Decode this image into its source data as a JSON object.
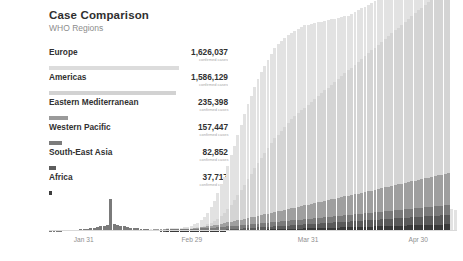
{
  "header": {
    "title": "Case Comparison",
    "subtitle": "WHO Regions"
  },
  "legend": {
    "value_sublabel": "confirmed cases",
    "items": [
      {
        "label": "Europe",
        "value": "1,626,037",
        "numeric": 1626037,
        "color": "#dcdcdc"
      },
      {
        "label": "Americas",
        "value": "1,586,129",
        "numeric": 1586129,
        "color": "#d2d2d2"
      },
      {
        "label": "Eastern Mediterranean",
        "value": "235,398",
        "numeric": 235398,
        "color": "#9a9a9a"
      },
      {
        "label": "Western Pacific",
        "value": "157,447",
        "numeric": 157447,
        "color": "#7c7c7c"
      },
      {
        "label": "South-East Asia",
        "value": "82,852",
        "numeric": 82852,
        "color": "#5d5d5d"
      },
      {
        "label": "Africa",
        "value": "37,717",
        "numeric": 37717,
        "color": "#3d3d3d"
      }
    ]
  },
  "chart_data": {
    "type": "bar",
    "stacked": true,
    "title": "Case Comparison",
    "subtitle": "WHO Regions",
    "xlabel": "",
    "ylabel": "",
    "grid": false,
    "legend_position": "left-panel",
    "xticks": [
      {
        "label": "Jan 31",
        "position_pct": 8.5
      },
      {
        "label": "Feb 29",
        "position_pct": 35.0
      },
      {
        "label": "Mar 31",
        "position_pct": 63.5
      },
      {
        "label": "Apr 30",
        "position_pct": 90.5
      }
    ],
    "ymax": 103000,
    "series": [
      {
        "name": "Europe",
        "color": "#e2e2e2",
        "values": [
          0,
          0,
          0,
          0,
          0,
          0,
          0,
          0,
          0,
          0,
          0,
          0,
          0,
          0,
          0,
          0,
          0,
          0,
          0,
          0,
          0,
          0,
          0,
          0,
          0,
          0,
          2,
          2,
          3,
          5,
          8,
          12,
          18,
          28,
          40,
          62,
          95,
          150,
          230,
          340,
          520,
          760,
          1100,
          1600,
          2250,
          3100,
          4200,
          5600,
          7400,
          9500,
          12000,
          14500,
          17000,
          20500,
          23500,
          26000,
          28500,
          31000,
          33500,
          35500,
          37000,
          38500,
          40000,
          41000,
          41500,
          42000,
          42500,
          43000,
          43000,
          42500,
          42000,
          41500,
          41000,
          40500,
          40000,
          39500,
          39000,
          38000,
          37000,
          36000,
          35000,
          34000,
          33000,
          32000,
          31000,
          30000,
          29000,
          28000,
          27000,
          26000,
          25500,
          25000,
          24500,
          24000,
          23500,
          23000,
          22500,
          22000,
          21500,
          21000,
          20500,
          20000,
          19500,
          19000,
          18500,
          18000,
          17500,
          17000,
          16500,
          16000,
          15500,
          15000,
          14500,
          14000,
          13500,
          13000,
          12500,
          12000,
          11500,
          11000,
          10500,
          10000
        ],
        "note": "daily new confirmed cases"
      },
      {
        "name": "Americas",
        "color": "#d4d4d4",
        "values": [
          0,
          0,
          0,
          0,
          0,
          0,
          0,
          0,
          0,
          0,
          0,
          0,
          0,
          0,
          0,
          0,
          0,
          0,
          0,
          0,
          0,
          0,
          0,
          0,
          0,
          0,
          0,
          0,
          0,
          0,
          0,
          0,
          1,
          1,
          2,
          3,
          5,
          8,
          14,
          22,
          35,
          55,
          90,
          150,
          250,
          400,
          620,
          950,
          1400,
          2000,
          2800,
          3800,
          5000,
          6400,
          8000,
          9800,
          11800,
          14000,
          16200,
          18500,
          20800,
          23000,
          25000,
          27000,
          29000,
          31000,
          33000,
          35000,
          36500,
          38000,
          39500,
          41000,
          42500,
          43500,
          44500,
          45500,
          46500,
          47500,
          48500,
          49500,
          50500,
          51500,
          52500,
          53500,
          54500,
          55500,
          56500,
          57500,
          58500,
          59500,
          60500,
          61500,
          62500,
          63500,
          64500,
          65500,
          66500,
          67500,
          68500,
          69500,
          70500,
          71500,
          72500,
          73500,
          74500,
          75500,
          76500,
          77500,
          78500,
          79500,
          80500,
          81500,
          82500,
          83500,
          84500,
          85500,
          86500,
          87500,
          88500,
          89500
        ],
        "note": "daily new confirmed cases"
      },
      {
        "name": "Eastern Mediterranean",
        "color": "#9f9f9f",
        "values": [
          0,
          0,
          0,
          0,
          0,
          0,
          0,
          0,
          0,
          0,
          0,
          0,
          0,
          0,
          0,
          0,
          0,
          0,
          0,
          0,
          0,
          0,
          0,
          0,
          0,
          0,
          0,
          0,
          0,
          0,
          0,
          1,
          1,
          2,
          3,
          5,
          8,
          12,
          20,
          35,
          60,
          100,
          160,
          240,
          340,
          460,
          600,
          760,
          940,
          1100,
          1300,
          1500,
          1700,
          1900,
          2100,
          2300,
          2500,
          2700,
          2900,
          3100,
          3300,
          3500,
          3700,
          3900,
          4100,
          4300,
          4500,
          4700,
          4900,
          5100,
          5300,
          5500,
          5700,
          5900,
          6100,
          6300,
          6500,
          6700,
          6900,
          7100,
          7300,
          7500,
          7700,
          7900,
          8100,
          8300,
          8500,
          8700,
          8900,
          9100,
          9300,
          9500,
          9700,
          9900,
          10100,
          10300,
          10500,
          10700,
          10900,
          11100,
          11300,
          11500,
          11700,
          11900,
          12100,
          12300,
          12500,
          12700,
          12900,
          13100,
          13300,
          13500,
          13700,
          13900,
          14100,
          14300,
          14500,
          14700,
          14900,
          15100
        ],
        "note": "daily new confirmed cases"
      },
      {
        "name": "Western Pacific",
        "color": "#7a7a7a",
        "values": [
          90,
          120,
          160,
          210,
          280,
          360,
          450,
          560,
          680,
          820,
          980,
          1150,
          1350,
          1600,
          1900,
          2200,
          2600,
          3000,
          15000,
          3400,
          3000,
          2600,
          2200,
          1900,
          1600,
          1400,
          1200,
          1000,
          900,
          800,
          700,
          620,
          560,
          500,
          460,
          420,
          400,
          420,
          450,
          500,
          560,
          620,
          700,
          780,
          860,
          940,
          1000,
          1050,
          1100,
          1150,
          1200,
          1250,
          1300,
          1350,
          1400,
          1450,
          1500,
          1550,
          1600,
          1650,
          1700,
          1750,
          1800,
          1850,
          1900,
          1950,
          2000,
          2050,
          2100,
          2150,
          2200,
          2250,
          2300,
          2350,
          2400,
          2450,
          2500,
          2550,
          2600,
          2650,
          2700,
          2750,
          2800,
          2850,
          2900,
          2950,
          3000,
          3050,
          3100,
          3150,
          3200,
          3250,
          3300,
          3350,
          3400,
          3450,
          3500,
          3550,
          3600,
          3650,
          3700,
          3750,
          3800,
          3850,
          3900,
          3950,
          4000,
          4050,
          4100,
          4150,
          4200,
          4250,
          4300,
          4350,
          4400,
          4450,
          4500,
          4550,
          4600,
          4650
        ],
        "note": "daily new confirmed cases; large spike on Feb 13 from case definition change"
      },
      {
        "name": "South-East Asia",
        "color": "#5a5a5a",
        "values": [
          0,
          0,
          0,
          0,
          0,
          0,
          0,
          0,
          0,
          0,
          0,
          0,
          0,
          0,
          0,
          0,
          0,
          0,
          0,
          0,
          0,
          0,
          0,
          0,
          0,
          0,
          0,
          0,
          0,
          0,
          0,
          0,
          0,
          1,
          1,
          2,
          3,
          5,
          8,
          12,
          18,
          28,
          42,
          62,
          90,
          125,
          165,
          210,
          260,
          310,
          360,
          420,
          480,
          540,
          600,
          660,
          720,
          780,
          840,
          900,
          960,
          1020,
          1080,
          1140,
          1200,
          1260,
          1320,
          1380,
          1440,
          1500,
          1560,
          1620,
          1680,
          1740,
          1800,
          1860,
          1920,
          1980,
          2040,
          2100,
          2160,
          2220,
          2280,
          2340,
          2400,
          2460,
          2520,
          2580,
          2640,
          2700,
          2760,
          2820,
          2880,
          2940,
          3000,
          3060,
          3120,
          3180,
          3240,
          3300,
          3360,
          3420,
          3480,
          3540,
          3600,
          3660,
          3720,
          3780,
          3840,
          3900,
          3960,
          4020,
          4080,
          4140,
          4200,
          4260,
          4320,
          4380,
          4440,
          4500
        ],
        "note": "daily new confirmed cases"
      },
      {
        "name": "Africa",
        "color": "#3a3a3a",
        "values": [
          0,
          0,
          0,
          0,
          0,
          0,
          0,
          0,
          0,
          0,
          0,
          0,
          0,
          0,
          0,
          0,
          0,
          0,
          0,
          0,
          0,
          0,
          0,
          0,
          0,
          0,
          0,
          0,
          0,
          0,
          0,
          0,
          0,
          0,
          0,
          1,
          1,
          2,
          3,
          5,
          8,
          12,
          18,
          26,
          38,
          52,
          70,
          92,
          115,
          140,
          168,
          198,
          230,
          262,
          296,
          330,
          366,
          402,
          440,
          478,
          516,
          556,
          596,
          636,
          678,
          720,
          762,
          804,
          848,
          892,
          936,
          980,
          1025,
          1070,
          1115,
          1160,
          1206,
          1252,
          1298,
          1344,
          1390,
          1436,
          1482,
          1528,
          1574,
          1620,
          1666,
          1712,
          1758,
          1804,
          1850,
          1896,
          1942,
          1988,
          2034,
          2080,
          2126,
          2172,
          2218,
          2264,
          2310,
          2356,
          2402,
          2448,
          2494,
          2540,
          2586,
          2632,
          2678,
          2724,
          2770,
          2816,
          2862,
          2908,
          2954,
          3000,
          3046,
          3092,
          3138,
          3184
        ],
        "note": "daily new confirmed cases"
      }
    ]
  }
}
